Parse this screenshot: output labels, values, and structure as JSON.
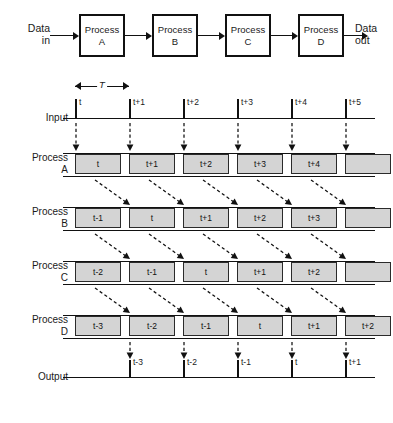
{
  "block_diagram": {
    "input_label": "Data\nin",
    "output_label": "Data\nout",
    "boxes": [
      {
        "line1": "Process",
        "line2": "A"
      },
      {
        "line1": "Process",
        "line2": "B"
      },
      {
        "line1": "Process",
        "line2": "C"
      },
      {
        "line1": "Process",
        "line2": "D"
      }
    ]
  },
  "timing": {
    "period_label": "T",
    "input": {
      "label": "Input",
      "ticks": [
        "t",
        "t+1",
        "t+2",
        "t+3",
        "t+4",
        "t+5"
      ]
    },
    "rows": [
      {
        "label": "Process\nA",
        "name": "process-a",
        "slots": [
          "t",
          "t+1",
          "t+2",
          "t+3",
          "t+4",
          ""
        ]
      },
      {
        "label": "Process\nB",
        "name": "process-b",
        "slots": [
          "t-1",
          "t",
          "t+1",
          "t+2",
          "t+3",
          ""
        ]
      },
      {
        "label": "Process\nC",
        "name": "process-c",
        "slots": [
          "t-2",
          "t-1",
          "t",
          "t+1",
          "t+2",
          ""
        ]
      },
      {
        "label": "Process\nD",
        "name": "process-d",
        "slots": [
          "t-3",
          "t-2",
          "t-1",
          "t",
          "t+1",
          "t+2"
        ]
      }
    ],
    "output": {
      "label": "Output",
      "ticks": [
        "t-3",
        "t-2",
        "t-1",
        "t",
        "t+1"
      ]
    }
  },
  "colors": {
    "line": "#111111",
    "slot_fill": "#d4d4d4",
    "slot_border": "#2b2b2b",
    "background": "#ffffff"
  }
}
